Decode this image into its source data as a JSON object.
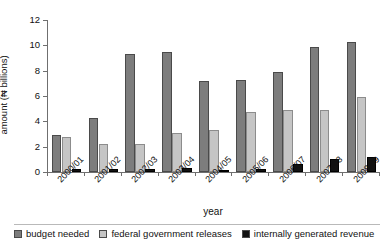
{
  "chart_data": {
    "type": "bar",
    "title": "",
    "xlabel": "year",
    "ylabel": "amount (₦ billions)",
    "categories": [
      "2000/01",
      "2001/02",
      "2002/03",
      "2003/04",
      "2004/05",
      "2005/06",
      "2006/07",
      "2007/08",
      "2008/09"
    ],
    "series": [
      {
        "name": "budget needed",
        "color": "#7d7d7d",
        "values": [
          2.9,
          4.3,
          9.3,
          9.5,
          7.2,
          7.3,
          7.9,
          9.9,
          10.3
        ]
      },
      {
        "name": "federal government releases",
        "color": "#c5c5c5",
        "values": [
          2.8,
          2.2,
          2.25,
          3.1,
          3.3,
          4.7,
          4.9,
          4.9,
          5.9
        ]
      },
      {
        "name": "internally generated revenue",
        "color": "#121212",
        "values": [
          0.2,
          0.25,
          0.2,
          0.3,
          0.15,
          0.25,
          0.6,
          1.0,
          1.2
        ]
      }
    ],
    "ylim": [
      0,
      12
    ],
    "yticks": [
      0,
      2,
      4,
      6,
      8,
      10,
      12
    ],
    "grid": false,
    "legend_position": "bottom"
  }
}
